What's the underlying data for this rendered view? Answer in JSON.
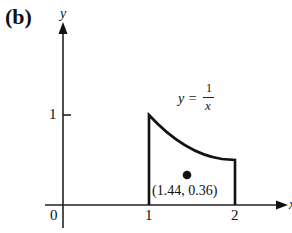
{
  "panel_label": "(b)",
  "axes": {
    "x_label": "x",
    "y_label": "y",
    "origin_label": "0",
    "x_ticks": [
      "1",
      "2"
    ],
    "y_ticks": [
      "1"
    ]
  },
  "curve": {
    "label_lhs": "y =",
    "label_num": "1",
    "label_den": "x"
  },
  "centroid": {
    "label": "(1.44, 0.36)",
    "x": 1.44,
    "y": 0.36
  },
  "colors": {
    "ink": "#111111",
    "background": "#ffffff"
  }
}
